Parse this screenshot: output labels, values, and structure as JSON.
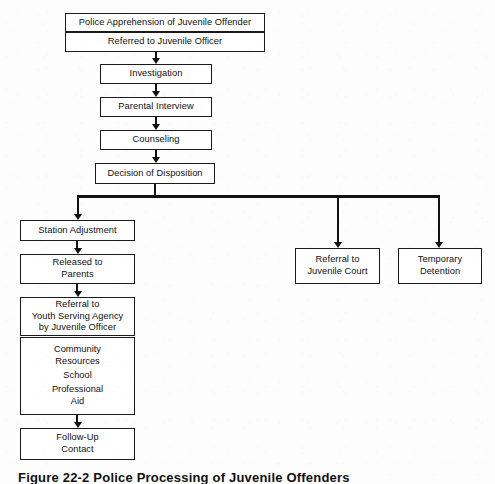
{
  "diagram": {
    "title_caption": "Figure 22-2  Police Processing of Juvenile Offenders",
    "line_color": "#111111",
    "box_fill": "#ffffff",
    "background": "#fdfdfd",
    "nodes": {
      "apprehension": "Police Apprehension of Juvenile Offender",
      "referred_officer": "Referred to Juvenile Officer",
      "investigation": "Investigation",
      "parental_interview": "Parental Interview",
      "counseling": "Counseling",
      "decision": "Decision of Disposition",
      "station_adjustment": "Station Adjustment",
      "released_parents_l1": "Released to",
      "released_parents_l2": "Parents",
      "referral_agency_l1": "Referral to",
      "referral_agency_l2": "Youth Serving Agency",
      "referral_agency_l3": "by Juvenile Officer",
      "service_community_l1": "Community",
      "service_community_l2": "Resources",
      "service_school": "School",
      "service_professional_l1": "Professional",
      "service_professional_l2": "Aid",
      "followup_l1": "Follow-Up",
      "followup_l2": "Contact",
      "juvenile_court_l1": "Referral to",
      "juvenile_court_l2": "Juvenile Court",
      "temporary_detention_l1": "Temporary",
      "temporary_detention_l2": "Detention"
    }
  }
}
